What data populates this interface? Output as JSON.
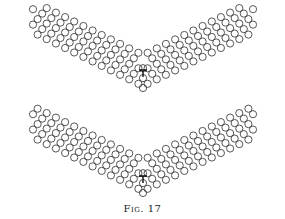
{
  "figure": {
    "caption": "Fig. 17",
    "circle_radius": 3.6,
    "stroke_color": "#444444",
    "panels": [
      {
        "name": "upper-lattice",
        "vertex": [
          143,
          86
        ],
        "dislocation": [
          143,
          70
        ]
      },
      {
        "name": "lower-lattice",
        "vertex": [
          143,
          191
        ],
        "dislocation": [
          143,
          176
        ]
      }
    ],
    "arm": {
      "rows": 5,
      "cols": 12,
      "step_along": 10.2,
      "step_across": 8.6,
      "slope_deg": 26
    }
  }
}
